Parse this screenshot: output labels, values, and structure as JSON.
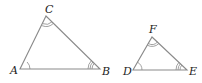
{
  "figure": {
    "colors": {
      "edge": "#8a8a8a",
      "label": "#222222",
      "background": "#ffffff"
    },
    "triangles": [
      {
        "name": "ABC",
        "vertices": {
          "A": {
            "label": "A",
            "x": 20,
            "y": 69,
            "angle_marks": 1
          },
          "B": {
            "label": "B",
            "x": 100,
            "y": 69,
            "angle_marks": 3
          },
          "C": {
            "label": "C",
            "x": 46,
            "y": 16,
            "angle_marks": 2
          }
        }
      },
      {
        "name": "DEF",
        "vertices": {
          "D": {
            "label": "D",
            "x": 133,
            "y": 70,
            "angle_marks": 1
          },
          "E": {
            "label": "E",
            "x": 187,
            "y": 70,
            "angle_marks": 3
          },
          "F": {
            "label": "F",
            "x": 152,
            "y": 37,
            "angle_marks": 2
          }
        }
      }
    ]
  }
}
